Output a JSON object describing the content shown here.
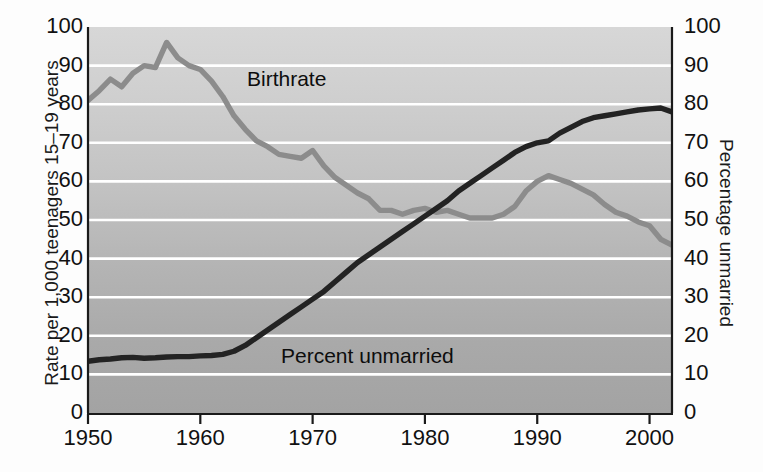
{
  "chart_data": {
    "type": "line",
    "title": "",
    "xlabel": "",
    "ylabel": "Rate per 1,000 teenagers 15–19 years",
    "ylabel_right": "Percentage unmarried",
    "xlim": [
      1950,
      2002
    ],
    "ylim": [
      0,
      100
    ],
    "ylim_right": [
      0,
      100
    ],
    "grid": true,
    "gridlines": [
      10,
      20,
      30,
      40,
      50,
      60,
      70,
      80,
      90
    ],
    "xticks": [
      1950,
      1960,
      1970,
      1980,
      1990,
      2000
    ],
    "xtick_labels": [
      "1950",
      "1960",
      "1970",
      "1980",
      "1990",
      "2000"
    ],
    "yticks": [
      0,
      10,
      20,
      30,
      40,
      50,
      60,
      70,
      80,
      90,
      100
    ],
    "ytick_labels": [
      "0",
      "10",
      "20",
      "30",
      "40",
      "50",
      "60",
      "70",
      "80",
      "90",
      "100"
    ],
    "ytick_labels_right": [
      "0",
      "10",
      "20",
      "30",
      "40",
      "50",
      "60",
      "70",
      "80",
      "90",
      "100"
    ],
    "legend_position": "inline-annotations",
    "series": [
      {
        "name": "Birthrate",
        "label": "Birthrate",
        "color": "#8c8c8c",
        "axis": "left",
        "units": "births per 1,000 teenagers 15-19",
        "x": [
          1950,
          1951,
          1952,
          1953,
          1954,
          1955,
          1956,
          1957,
          1958,
          1959,
          1960,
          1961,
          1962,
          1963,
          1964,
          1965,
          1966,
          1967,
          1968,
          1969,
          1970,
          1971,
          1972,
          1973,
          1974,
          1975,
          1976,
          1977,
          1978,
          1979,
          1980,
          1981,
          1982,
          1983,
          1984,
          1985,
          1986,
          1987,
          1988,
          1989,
          1990,
          1991,
          1992,
          1993,
          1994,
          1995,
          1996,
          1997,
          1998,
          1999,
          2000,
          2001,
          2002
        ],
        "values": [
          81.0,
          83.5,
          86.5,
          84.5,
          88.0,
          90.0,
          89.5,
          96.0,
          92.0,
          90.0,
          89.0,
          86.0,
          82.0,
          77.0,
          73.5,
          70.5,
          69.0,
          67.0,
          66.5,
          66.0,
          68.0,
          64.0,
          61.0,
          59.0,
          57.0,
          55.5,
          52.5,
          52.5,
          51.5,
          52.5,
          53.0,
          52.0,
          52.5,
          51.5,
          50.5,
          50.5,
          50.5,
          51.5,
          53.5,
          57.5,
          60.0,
          61.5,
          60.5,
          59.5,
          58.0,
          56.5,
          54.0,
          52.0,
          51.0,
          49.5,
          48.5,
          45.0,
          43.5
        ]
      },
      {
        "name": "Percent unmarried",
        "label": "Percent unmarried",
        "color": "#232323",
        "axis": "right",
        "units": "percentage of teen births to unmarried mothers",
        "x": [
          1950,
          1951,
          1952,
          1953,
          1954,
          1955,
          1956,
          1957,
          1958,
          1959,
          1960,
          1961,
          1962,
          1963,
          1964,
          1965,
          1966,
          1967,
          1968,
          1969,
          1970,
          1971,
          1972,
          1973,
          1974,
          1975,
          1976,
          1977,
          1978,
          1979,
          1980,
          1981,
          1982,
          1983,
          1984,
          1985,
          1986,
          1987,
          1988,
          1989,
          1990,
          1991,
          1992,
          1993,
          1994,
          1995,
          1996,
          1997,
          1998,
          1999,
          2000,
          2001,
          2002
        ],
        "values": [
          13.4,
          13.8,
          14.0,
          14.3,
          14.4,
          14.2,
          14.3,
          14.5,
          14.6,
          14.6,
          14.8,
          14.9,
          15.2,
          16.0,
          17.5,
          19.5,
          21.5,
          23.5,
          25.5,
          27.5,
          29.5,
          31.5,
          34.0,
          36.5,
          39.0,
          41.0,
          43.0,
          45.0,
          47.0,
          49.0,
          51.0,
          53.0,
          55.0,
          57.5,
          59.5,
          61.5,
          63.5,
          65.5,
          67.5,
          69.0,
          70.0,
          70.5,
          72.5,
          74.0,
          75.5,
          76.5,
          77.0,
          77.5,
          78.0,
          78.5,
          78.8,
          79.0,
          78.0
        ]
      }
    ]
  },
  "axes": {
    "left_title": "Rate per 1,000 teenagers 15–19 years",
    "right_title": "Percentage unmarried"
  },
  "annotations": {
    "birthrate": "Birthrate",
    "unmarried": "Percent unmarried"
  },
  "colors": {
    "birthrate_line": "#8c8c8c",
    "unmarried_line": "#232323",
    "gridline": "#ffffff",
    "axis": "#1a1a1a",
    "plot_bg_top": "#d7d7d7",
    "plot_bg_bottom": "#a3a3a3",
    "page_bg": "#fdfdfd"
  }
}
